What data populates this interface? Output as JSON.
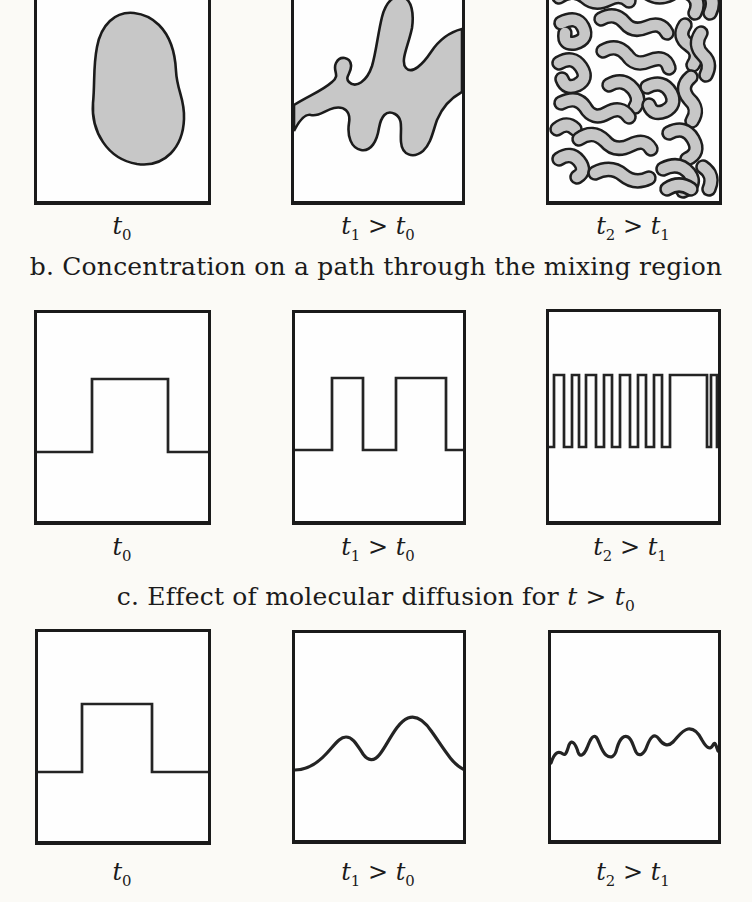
{
  "figure": {
    "title_semantic": "turbulent mixing and molecular diffusion schematic",
    "background_color": "#fbfaf6",
    "ink_color": "#1c1c1c",
    "blob_fill_color": "#c7c7c7"
  },
  "headers": {
    "b": "b. Concentration on a path through the mixing region",
    "c": "c. Effect of molecular diffusion for t > t_0"
  },
  "rows": {
    "a": {
      "labels": [
        "t_0",
        "t_1 > t_0",
        "t_2 > t_1"
      ]
    },
    "b": {
      "labels": [
        "t_0",
        "t_1 > t_0",
        "t_2 > t_1"
      ]
    },
    "c": {
      "labels": [
        "t_0",
        "t_1 > t_0",
        "t_2 > t_1"
      ]
    }
  },
  "art": {
    "blob_t0": "M97,50 C78,48 64,62 60,84 C56,104 58,120 56,140 C54,168 70,196 100,201 C128,205 146,184 147,156 C148,136 140,128 139,108 C138,86 132,72 122,62 C114,54 106,51 97,50 Z",
    "blob_t1": "M0,142 C16,132 28,128 38,119 C47,112 38,108 42,100 C46,92 56,94 57,102 C58,110 50,114 55,119 C62,126 73,118 78,103 C82,90 84,70 88,54 C92,38 101,31 109,34 C118,37 120,51 118,65 C114,84 106,98 112,105 C118,112 129,101 137,89 C145,77 156,69 168,66 L168,129 C157,135 148,145 143,157 C139,168 137,181 129,188 C119,196 108,192 107,179 C106,167 110,156 101,151 C92,146 87,154 85,165 C83,178 77,189 67,187 C57,185 53,173 55,160 C57,148 50,143 40,145 C31,147 25,154 17,152 C10,150 4,160 0,168 Z",
    "marble": [
      "M8,10 Q20,2 32,10 Q42,17 54,10",
      "M70,6 Q82,16 96,9 Q108,3 118,10",
      "M132,6 Q144,14 156,7 Q163,3 166,10",
      "M10,34 Q24,24 36,34 Q46,43 60,36 Q72,30 80,38",
      "M96,28 Q108,38 122,31 Q134,24 144,33 Q151,40 146,50",
      "M158,28 Q167,38 161,50",
      "M12,60 Q28,52 34,64 Q40,76 26,80 Q14,82 16,70",
      "M52,56 Q66,48 76,60 Q84,70 98,64 Q112,58 118,70",
      "M136,62 Q128,74 140,82 Q152,90 144,102",
      "M152,70 Q144,82 154,92 Q163,100 157,112",
      "M10,100 Q24,92 32,104 Q40,116 28,122 Q17,127 13,116",
      "M54,88 Q68,80 78,92 Q86,104 100,98 Q116,91 120,105",
      "M60,122 Q74,114 84,126 Q92,136 86,144",
      "M142,114 Q130,124 140,136 Q151,146 143,158",
      "M12,140 Q28,132 36,144 Q44,158 58,150 Q72,142 80,154",
      "M98,124 Q114,116 122,130 Q128,142 116,148 Q104,153 100,142",
      "M8,166 Q18,158 26,166",
      "M30,176 Q44,166 56,178 Q66,190 82,182 Q96,175 102,186",
      "M120,170 Q136,162 144,176 Q152,190 138,196",
      "M10,196 Q22,188 30,198 Q38,208 28,214",
      "M46,210 Q62,202 74,212 Q86,222 100,215",
      "M114,206 Q130,198 140,210 Q149,222 134,228",
      "M154,204 Q166,212 160,226",
      "M118,226 Q130,218 142,226"
    ],
    "marble_outline_color": "#1e1e1e",
    "marble_fill_color": "#c7c7c7",
    "marble_outline_width": 15.5,
    "marble_fill_width": 10.5,
    "wave_b": [
      "M0,139 H55 V66 H131 V139 H171",
      "M0,137 H37 V65 H68 V137 H101 V65 H151 V137 H168",
      "M0,135 H5 V63 H15 V135 H23 V63 H30 V135 H37 V63 H47 V135 H55 V63 H63 V135 H71 V63 H81 V135 H89 V63 H97 V135 H105 V63 H113 V135 H121 V63 H158 V135 H162 V63 H168 V135 H169"
    ],
    "curve_c": [
      "M0,140 H44 V72 H114 V140 H170",
      "M0,137 C12,137 22,131 32,120 C41,110 45,104 51,104 C58,104 62,112 68,121 C73,128 79,129 85,121 C93,111 101,90 113,85 C121,82 129,87 137,99 C147,113 157,131 168,136",
      "M0,130 C4,118 8,118 12,121 C15,123 16,118 18,112 C21,105 25,112 27,119 C29,125 33,122 36,115 C38,110 41,101 45,104 C48,107 50,118 55,122 C60,126 64,124 66,115 C69,105 73,102 77,104 C81,106 82,113 85,119 C88,124 93,122 96,113 C99,105 103,99 108,106 C112,112 117,114 122,109 C127,104 131,97 137,96 C143,95 148,101 151,107 C155,114 159,118 162,112 C164,108 165,112 167,118"
    ]
  }
}
